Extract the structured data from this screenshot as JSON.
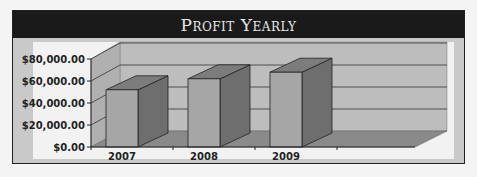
{
  "chart_data": {
    "type": "bar",
    "style": "3d-column",
    "title": "Profit Yearly",
    "categories": [
      "2007",
      "2008",
      "2009"
    ],
    "values": [
      52000,
      62000,
      68000
    ],
    "xlabel": "",
    "ylabel": "",
    "ylim": [
      0,
      80000
    ],
    "yticks": [
      "$0.00",
      "$20,000.00",
      "$40,000.00",
      "$60,000.00",
      "$80,000.00"
    ],
    "grid": true,
    "legend": null
  },
  "header": {
    "title": "Profit Yearly"
  },
  "colors": {
    "header_bg": "#1a1a1a",
    "header_text": "#e8e8e8",
    "frame_bg": "#c9c9c9",
    "plot_wall": "#bdbdbd",
    "plot_floor": "#8a8a8a",
    "bar_front": "#a6a6a6",
    "bar_side": "#6e6e6e",
    "bar_top": "#7c7c7c"
  }
}
